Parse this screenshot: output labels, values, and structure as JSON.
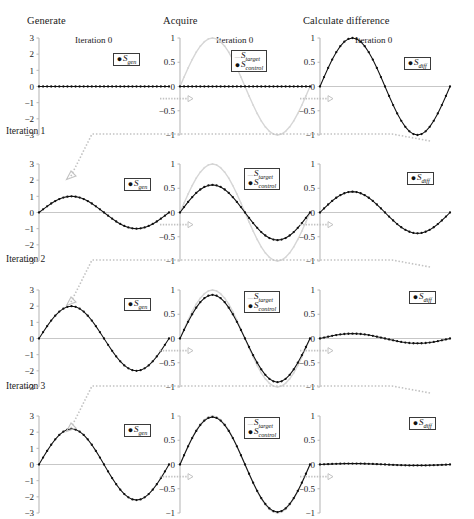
{
  "figure": {
    "width": 474,
    "height": 519,
    "columns": [
      {
        "id": "generate",
        "label": "Generate"
      },
      {
        "id": "acquire",
        "label": "Acquire"
      },
      {
        "id": "difference",
        "label": "Calculate difference"
      }
    ],
    "row_labels": [
      "Iteration 1",
      "Iteration 2",
      "Iteration 3"
    ],
    "iteration_titles": [
      "Iteration 0",
      "Iteration 0",
      "Iteration 0"
    ],
    "legends": {
      "gen": {
        "marker": "dot-marker",
        "label": "S",
        "sub": "gen"
      },
      "target": {
        "marker": "dash-marker",
        "label": "S",
        "sub": "target"
      },
      "control": {
        "marker": "dot-marker",
        "label": "S",
        "sub": "control"
      },
      "diff": {
        "marker": "dot-marker",
        "label": "S",
        "sub": "diff"
      }
    },
    "colors": {
      "data_line": "#111111",
      "target_line": "#d6d6d6",
      "axis": "#b9b9b9",
      "connector": "#c2c2c2",
      "text": "#1a1a1a"
    }
  },
  "chart_data": [
    {
      "type": "line",
      "panel": "row1-generate",
      "title": "Iteration 0",
      "ylabel": "",
      "xlabel": "",
      "ylim": [
        -3,
        3
      ],
      "yticks": [
        3,
        2,
        1,
        0,
        -1,
        -2,
        -3
      ],
      "ytick_labels": [
        "3",
        "2",
        "1",
        "0",
        "−1",
        "−2",
        "−3"
      ],
      "xlim": [
        0,
        1
      ],
      "grid": false,
      "series": [
        {
          "name": "S_gen",
          "amplitude": 0,
          "cycles": 1,
          "markers": true,
          "color": "#111111"
        }
      ]
    },
    {
      "type": "line",
      "panel": "row1-acquire",
      "title": "Iteration 0",
      "ylim": [
        -1,
        1
      ],
      "yticks": [
        1,
        0.5,
        0,
        -0.5,
        -1
      ],
      "ytick_labels": [
        "1",
        "0.5",
        "0",
        "−0.5",
        "−1"
      ],
      "xlim": [
        0,
        1
      ],
      "grid": false,
      "series": [
        {
          "name": "S_target",
          "amplitude": 1,
          "cycles": 1,
          "markers": true,
          "color": "#d6d6d6"
        },
        {
          "name": "S_control",
          "amplitude": 0,
          "cycles": 1,
          "markers": true,
          "color": "#111111"
        }
      ]
    },
    {
      "type": "line",
      "panel": "row1-difference",
      "title": "Iteration 0",
      "ylim": [
        -1,
        1
      ],
      "yticks": [
        1,
        0.5,
        0,
        -0.5,
        -1
      ],
      "ytick_labels": [
        "1",
        "0.5",
        "0",
        "−0.5",
        "−1"
      ],
      "xlim": [
        0,
        1
      ],
      "grid": false,
      "series": [
        {
          "name": "S_diff",
          "amplitude": 1,
          "cycles": 1,
          "markers": true,
          "color": "#111111"
        }
      ]
    },
    {
      "type": "line",
      "panel": "row2-generate",
      "title": "Iteration 1",
      "ylim": [
        -3,
        3
      ],
      "yticks": [
        3,
        2,
        1,
        0,
        -1,
        -2,
        -3
      ],
      "ytick_labels": [
        "3",
        "2",
        "1",
        "0",
        "−1",
        "−2",
        "−3"
      ],
      "xlim": [
        0,
        1
      ],
      "grid": false,
      "series": [
        {
          "name": "S_gen",
          "amplitude": 1,
          "cycles": 1,
          "markers": true,
          "color": "#111111"
        }
      ]
    },
    {
      "type": "line",
      "panel": "row2-acquire",
      "ylim": [
        -1,
        1
      ],
      "yticks": [
        1,
        0.5,
        0,
        -0.5,
        -1
      ],
      "ytick_labels": [
        "1",
        "0.5",
        "0",
        "−0.5",
        "−1"
      ],
      "xlim": [
        0,
        1
      ],
      "grid": false,
      "series": [
        {
          "name": "S_target",
          "amplitude": 1,
          "cycles": 1,
          "markers": true,
          "color": "#d6d6d6"
        },
        {
          "name": "S_control",
          "amplitude": 0.57,
          "cycles": 1,
          "markers": true,
          "color": "#111111"
        }
      ]
    },
    {
      "type": "line",
      "panel": "row2-difference",
      "ylim": [
        -1,
        1
      ],
      "yticks": [
        1,
        0.5,
        0,
        -0.5,
        -1
      ],
      "ytick_labels": [
        "1",
        "0.5",
        "0",
        "−0.5",
        "−1"
      ],
      "xlim": [
        0,
        1
      ],
      "grid": false,
      "series": [
        {
          "name": "S_diff",
          "amplitude": 0.43,
          "cycles": 1,
          "markers": true,
          "color": "#111111"
        }
      ]
    },
    {
      "type": "line",
      "panel": "row3-generate",
      "title": "Iteration 2",
      "ylim": [
        -3,
        3
      ],
      "yticks": [
        3,
        2,
        1,
        0,
        -1,
        -2,
        -3
      ],
      "ytick_labels": [
        "3",
        "2",
        "1",
        "0",
        "−1",
        "−2",
        "−3"
      ],
      "xlim": [
        0,
        1
      ],
      "grid": false,
      "series": [
        {
          "name": "S_gen",
          "amplitude": 2,
          "cycles": 1,
          "markers": true,
          "color": "#111111"
        }
      ]
    },
    {
      "type": "line",
      "panel": "row3-acquire",
      "ylim": [
        -1,
        1
      ],
      "yticks": [
        1,
        0.5,
        0,
        -0.5,
        -1
      ],
      "ytick_labels": [
        "1",
        "0.5",
        "0",
        "−0.5",
        "−1"
      ],
      "xlim": [
        0,
        1
      ],
      "grid": false,
      "series": [
        {
          "name": "S_target",
          "amplitude": 1,
          "cycles": 1,
          "markers": true,
          "color": "#d6d6d6"
        },
        {
          "name": "S_control",
          "amplitude": 0.9,
          "cycles": 1,
          "markers": true,
          "color": "#111111"
        }
      ]
    },
    {
      "type": "line",
      "panel": "row3-difference",
      "ylim": [
        -1,
        1
      ],
      "yticks": [
        1,
        0.5,
        0,
        -0.5,
        -1
      ],
      "ytick_labels": [
        "1",
        "0.5",
        "0",
        "−0.5",
        "−1"
      ],
      "xlim": [
        0,
        1
      ],
      "grid": false,
      "series": [
        {
          "name": "S_diff",
          "amplitude": 0.1,
          "cycles": 1,
          "markers": true,
          "color": "#111111"
        }
      ]
    },
    {
      "type": "line",
      "panel": "row4-generate",
      "title": "Iteration 3",
      "ylim": [
        -3,
        3
      ],
      "yticks": [
        3,
        2,
        1,
        0,
        -1,
        -2,
        -3
      ],
      "ytick_labels": [
        "3",
        "2",
        "1",
        "0",
        "−1",
        "−2",
        "−3"
      ],
      "xlim": [
        0,
        1
      ],
      "grid": false,
      "series": [
        {
          "name": "S_gen",
          "amplitude": 2.2,
          "cycles": 1,
          "markers": true,
          "color": "#111111"
        }
      ]
    },
    {
      "type": "line",
      "panel": "row4-acquire",
      "ylim": [
        -1,
        1
      ],
      "yticks": [
        1,
        0.5,
        0,
        -0.5,
        -1
      ],
      "ytick_labels": [
        "1",
        "0.5",
        "0",
        "−0.5",
        "−1"
      ],
      "xlim": [
        0,
        1
      ],
      "grid": false,
      "series": [
        {
          "name": "S_target",
          "amplitude": 1,
          "cycles": 1,
          "markers": true,
          "color": "#d6d6d6"
        },
        {
          "name": "S_control",
          "amplitude": 0.98,
          "cycles": 1,
          "markers": true,
          "color": "#111111"
        }
      ]
    },
    {
      "type": "line",
      "panel": "row4-difference",
      "ylim": [
        -1,
        1
      ],
      "yticks": [
        1,
        0.5,
        0,
        -0.5,
        -1
      ],
      "ytick_labels": [
        "1",
        "0.5",
        "0",
        "−0.5",
        "−1"
      ],
      "xlim": [
        0,
        1
      ],
      "grid": false,
      "series": [
        {
          "name": "S_diff",
          "amplitude": 0.02,
          "cycles": 1,
          "markers": true,
          "color": "#111111"
        }
      ]
    }
  ]
}
